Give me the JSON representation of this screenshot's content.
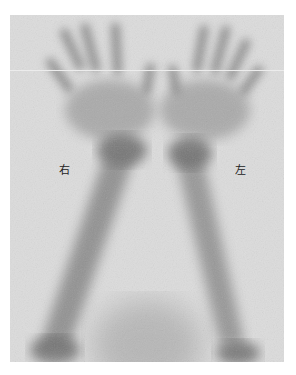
{
  "image": {
    "type": "bone-scintigraphy-hands-forearms",
    "labels": {
      "right": "右",
      "left": "左"
    },
    "colors": {
      "background": "#dcdcdc",
      "uptake": "#5a5a5a",
      "page": "#ffffff"
    }
  }
}
